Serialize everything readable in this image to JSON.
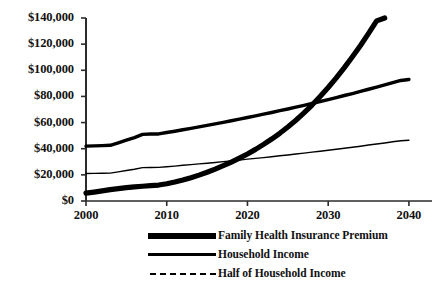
{
  "chart_data": {
    "type": "line",
    "title": "",
    "xlabel": "",
    "ylabel": "",
    "xlim": [
      2000,
      2041
    ],
    "ylim": [
      0,
      140000
    ],
    "grid": false,
    "legend_position": "below",
    "x_ticks": [
      "2000",
      "2010",
      "2020",
      "2030",
      "2040"
    ],
    "x_tick_values": [
      2000,
      2010,
      2020,
      2030,
      2040
    ],
    "y_ticks": [
      "$0",
      "$20,000",
      "$40,000",
      "$60,000",
      "$80,000",
      "$100,000",
      "$120,000",
      "$140,000"
    ],
    "y_tick_values": [
      0,
      20000,
      40000,
      60000,
      80000,
      100000,
      120000,
      140000
    ],
    "x": [
      2000,
      2001,
      2002,
      2003,
      2004,
      2005,
      2006,
      2007,
      2008,
      2009,
      2010,
      2011,
      2012,
      2013,
      2014,
      2015,
      2016,
      2017,
      2018,
      2019,
      2020,
      2021,
      2022,
      2023,
      2024,
      2025,
      2026,
      2027,
      2028,
      2029,
      2030,
      2031,
      2032,
      2033,
      2034,
      2035,
      2036,
      2037,
      2038,
      2039,
      2040
    ],
    "series": [
      {
        "name": "Family Health Insurance Premium",
        "style": "thick-solid",
        "color": "#000000",
        "values": [
          6000,
          6800,
          7700,
          8700,
          9500,
          10200,
          10800,
          11300,
          11700,
          12200,
          13200,
          14500,
          16000,
          17800,
          19800,
          22000,
          24400,
          27000,
          29800,
          32800,
          36000,
          39500,
          43300,
          47400,
          51800,
          56600,
          61800,
          67400,
          73400,
          79900,
          86800,
          94200,
          102000,
          110300,
          119000,
          128200,
          137800,
          140000,
          140000,
          140000,
          140000
        ]
      },
      {
        "name": "Household Income",
        "style": "medium-solid",
        "color": "#000000",
        "values": [
          42000,
          42200,
          42400,
          42600,
          44500,
          46500,
          48500,
          51000,
          51200,
          51300,
          52400,
          53400,
          54500,
          55600,
          56700,
          57800,
          59000,
          60200,
          61400,
          62600,
          63900,
          65100,
          66400,
          67700,
          69100,
          70400,
          71800,
          73200,
          74700,
          76100,
          77600,
          79100,
          80700,
          82200,
          83800,
          85500,
          87100,
          88800,
          90500,
          92200,
          93000
        ]
      },
      {
        "name": "Half of Household Income",
        "style": "thin-solid",
        "color": "#000000",
        "values": [
          21000,
          21100,
          21200,
          21300,
          22300,
          23300,
          24300,
          25500,
          25600,
          25700,
          26200,
          26700,
          27300,
          27800,
          28400,
          28900,
          29500,
          30100,
          30700,
          31300,
          32000,
          32600,
          33200,
          33900,
          34600,
          35200,
          35900,
          36600,
          37400,
          38100,
          38800,
          39600,
          40400,
          41100,
          41900,
          42800,
          43600,
          44400,
          45300,
          46100,
          46500
        ]
      }
    ]
  },
  "legend": {
    "items": [
      {
        "label": "Family Health Insurance Premium",
        "swatch": "thick-line-swatch"
      },
      {
        "label": "Household Income",
        "swatch": "medium-line-swatch"
      },
      {
        "label": "Half of Household Income",
        "swatch": "dashed-line-swatch"
      }
    ]
  }
}
